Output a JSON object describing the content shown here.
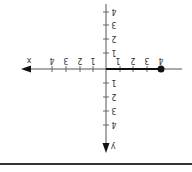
{
  "diagram": {
    "type": "coordinate-plane",
    "orientation": "rotated-180",
    "axes": {
      "x_label": "x",
      "y_label": "y",
      "x_ticks": [
        "1",
        "2",
        "3",
        "4"
      ],
      "x_ticks_neg_side": [
        "1",
        "2",
        "3",
        "4"
      ],
      "y_ticks": [
        "1",
        "2",
        "3",
        "4"
      ],
      "y_ticks_neg_side": [
        "1",
        "2",
        "3",
        "4"
      ]
    },
    "segment": {
      "from": 0,
      "to": 4,
      "endpoint": "closed-dot"
    },
    "colors": {
      "axis": "#444444",
      "segment": "#111111",
      "rule": "#333333"
    }
  }
}
